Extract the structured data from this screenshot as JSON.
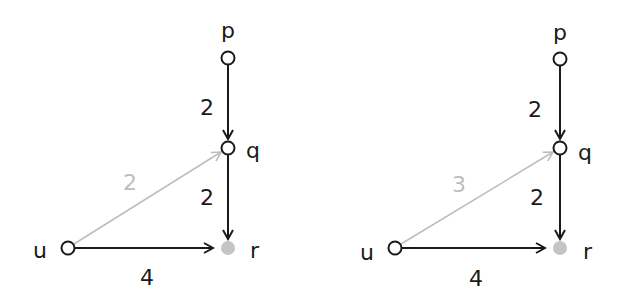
{
  "colors": {
    "edge": "#1a1a1a",
    "edge_highlight": "#bdbdbd",
    "node_stroke": "#1a1a1a",
    "node_fill": "#ffffff",
    "target_fill": "#c4c4c4"
  },
  "graphs": [
    {
      "nodes": {
        "p": {
          "label": "p"
        },
        "q": {
          "label": "q"
        },
        "r": {
          "label": "r"
        },
        "u": {
          "label": "u"
        }
      },
      "edges": [
        {
          "from": "p",
          "to": "q",
          "weight": "2",
          "style": "dark"
        },
        {
          "from": "q",
          "to": "r",
          "weight": "2",
          "style": "dark"
        },
        {
          "from": "u",
          "to": "q",
          "weight": "2",
          "style": "grey"
        },
        {
          "from": "u",
          "to": "r",
          "weight": "4",
          "style": "dark"
        }
      ]
    },
    {
      "nodes": {
        "p": {
          "label": "p"
        },
        "q": {
          "label": "q"
        },
        "r": {
          "label": "r"
        },
        "u": {
          "label": "u"
        }
      },
      "edges": [
        {
          "from": "p",
          "to": "q",
          "weight": "2",
          "style": "dark"
        },
        {
          "from": "q",
          "to": "r",
          "weight": "2",
          "style": "dark"
        },
        {
          "from": "u",
          "to": "q",
          "weight": "3",
          "style": "grey"
        },
        {
          "from": "u",
          "to": "r",
          "weight": "4",
          "style": "dark"
        }
      ]
    }
  ]
}
